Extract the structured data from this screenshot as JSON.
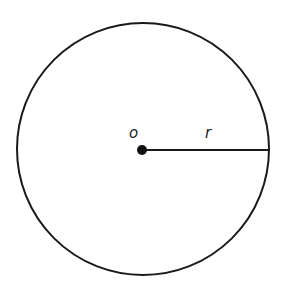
{
  "diagram": {
    "type": "geometry",
    "colors": {
      "background": "#ffffff",
      "stroke": "#1a1a1a"
    },
    "circle": {
      "cx": 143,
      "cy": 149,
      "r": 126,
      "stroke_width": 2
    },
    "center_point": {
      "label": "o",
      "x": 142,
      "y": 150,
      "dot_radius": 5
    },
    "radius_segment": {
      "label": "r",
      "x1": 142,
      "y1": 150,
      "x2": 269,
      "y2": 150,
      "stroke_width": 2
    }
  }
}
